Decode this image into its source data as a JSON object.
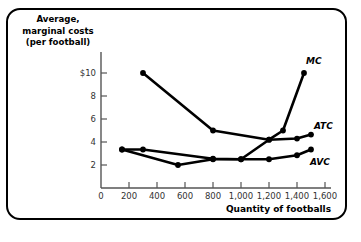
{
  "figure": {
    "border_color": "#000000",
    "background_color": "#ffffff",
    "line_color": "#000000",
    "axis_color": "#555555"
  },
  "chart_data": {
    "type": "line",
    "title": "",
    "ylabel_lines": [
      "Average,",
      "marginal costs",
      "(per football)"
    ],
    "ylabel": "Average, marginal costs (per football)",
    "xlabel": "Quantity of footballs",
    "xlim": [
      0,
      1600
    ],
    "ylim": [
      0,
      11
    ],
    "grid": false,
    "legend": "inline-labels",
    "xticks": [
      0,
      200,
      400,
      600,
      800,
      1000,
      1200,
      1400,
      1600
    ],
    "xtick_labels": [
      "0",
      "200",
      "400",
      "600",
      "800",
      "1,000",
      "1,200",
      "1,400",
      "1,600"
    ],
    "yticks": [
      2,
      4,
      6,
      8,
      10
    ],
    "ytick_labels": [
      "2",
      "4",
      "6",
      "8",
      "$10"
    ],
    "series": [
      {
        "name": "MC",
        "label": "MC",
        "marker": "filled-circle",
        "x": [
          300,
          800,
          1200,
          1300,
          1450
        ],
        "y": [
          10.0,
          5.0,
          4.2,
          5.0,
          10.0
        ]
      },
      {
        "name": "ATC",
        "label": "ATC",
        "marker": "filled-circle",
        "x": [
          150,
          300,
          800,
          1000,
          1200,
          1400,
          1500
        ],
        "y": [
          3.35,
          3.35,
          2.55,
          2.5,
          4.2,
          4.3,
          4.65
        ]
      },
      {
        "name": "AVC",
        "label": "AVC",
        "marker": "filled-circle",
        "x": [
          150,
          550,
          800,
          1000,
          1200,
          1400,
          1500
        ],
        "y": [
          3.35,
          2.0,
          2.5,
          2.5,
          2.5,
          2.85,
          3.35
        ]
      }
    ]
  }
}
